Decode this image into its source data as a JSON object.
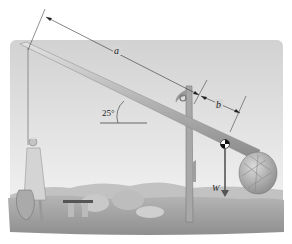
{
  "figure": {
    "labels": {
      "length_a": "a",
      "length_b": "b",
      "angle": "25°",
      "weight": "W"
    },
    "angle_degrees": 25,
    "colors": {
      "sky": "#d9d9d9",
      "pole": "#b9b9b9",
      "ground": "#a9a9a9",
      "dimension_line": "#333333",
      "weight_arrow": "#555555"
    }
  }
}
